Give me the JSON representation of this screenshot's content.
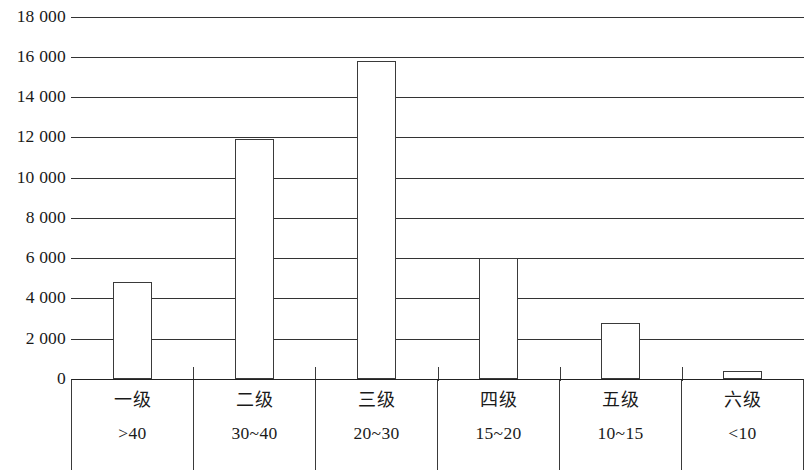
{
  "chart_data": {
    "type": "bar",
    "title": "",
    "xlabel": "",
    "ylabel": "",
    "categories": [
      "一级",
      "二级",
      "三级",
      "四级",
      "五级",
      "六级"
    ],
    "category_ranges": [
      ">40",
      "30~40",
      "20~30",
      "15~20",
      "10~15",
      "<10"
    ],
    "values": [
      4800,
      11900,
      15800,
      6000,
      2800,
      400
    ],
    "ylim": [
      0,
      18000
    ],
    "ytick_values": [
      0,
      2000,
      4000,
      6000,
      8000,
      10000,
      12000,
      14000,
      16000,
      18000
    ],
    "ytick_labels": [
      "0",
      "2 000",
      "4 000",
      "6 000",
      "8 000",
      "10 000",
      "12 000",
      "14 000",
      "16 000",
      "18 000"
    ],
    "grid": true,
    "grid_axis": "y",
    "legend": false,
    "bar_fill_color": "#ffffff",
    "bar_border_color": "#3a3a3a",
    "axis_color": "#222222",
    "background_color": "#ffffff"
  },
  "axis": {
    "y_labels": [
      "18 000",
      "16 000",
      "14 000",
      "12 000",
      "10 000",
      "8 000",
      "6 000",
      "4 000",
      "2 000",
      "0"
    ]
  },
  "categories": [
    {
      "grade": "一级",
      "range": ">40",
      "value": 4800
    },
    {
      "grade": "二级",
      "range": "30~40",
      "value": 11900
    },
    {
      "grade": "三级",
      "range": "20~30",
      "value": 15800
    },
    {
      "grade": "四级",
      "range": "15~20",
      "value": 6000
    },
    {
      "grade": "五级",
      "range": "10~15",
      "value": 2800
    },
    {
      "grade": "六级",
      "range": "<10",
      "value": 400
    }
  ]
}
